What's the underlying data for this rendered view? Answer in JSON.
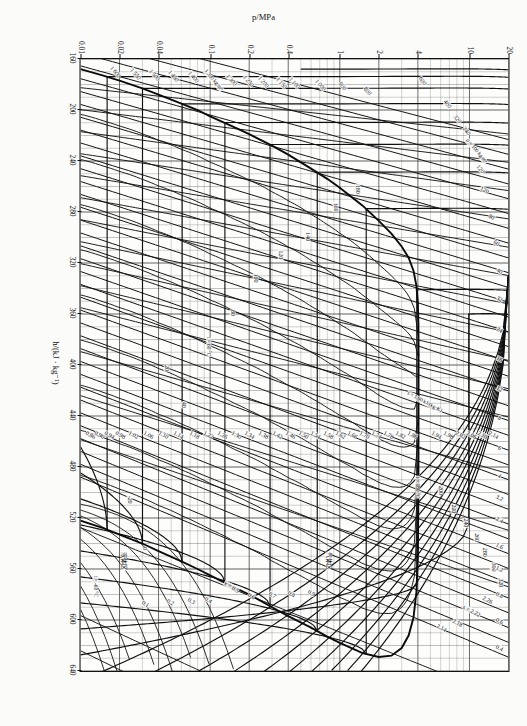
{
  "figure": {
    "kind": "pressure-enthalpy-mollier-diagram",
    "rotation_deg": 90,
    "page_background": "#fbfbfa",
    "ink_color": "#111111"
  },
  "chart_data": {
    "type": "line",
    "title": "",
    "subtitle": "",
    "xlabel": "h/(kJ · kg⁻¹)",
    "ylabel": "p/MPa",
    "xlim": [
      160,
      640
    ],
    "ylim": [
      0.01,
      20
    ],
    "yscale": "log",
    "grid": true,
    "legend_position": "none",
    "x_ticks": [
      160,
      200,
      240,
      280,
      320,
      360,
      400,
      440,
      480,
      520,
      560,
      600,
      640
    ],
    "x_tick_labels": [
      "160",
      "200",
      "240",
      "280",
      "320",
      "360",
      "400",
      "440",
      "480",
      "520",
      "560",
      "600",
      "640"
    ],
    "y_ticks": [
      0.01,
      0.02,
      0.04,
      0.1,
      0.2,
      0.4,
      1,
      2,
      4,
      10,
      20
    ],
    "y_tick_labels": [
      "0.01",
      "0.02",
      "0.04",
      "0.1",
      "0.2",
      "0.4",
      "1",
      "2",
      "4",
      "10",
      "20"
    ],
    "series": [
      {
        "name": "saturation-dome",
        "kind": "saturation boundary",
        "style": "heavy",
        "note": "bell-shaped two-phase envelope with critical point near h=390 kJ/kg, p=4 MPa"
      },
      {
        "name": "isotherms",
        "kind": "constant temperature t / °C",
        "unit": "°C",
        "values": [
          -60,
          -40,
          -20,
          0,
          20,
          40,
          60,
          80,
          100,
          120,
          140,
          160,
          180,
          200,
          220,
          240,
          260,
          280,
          300,
          320
        ],
        "labelled": [
          "t = -60 °C",
          "t = 60 °C",
          "t = 180 °C"
        ]
      },
      {
        "name": "isentropes",
        "kind": "constant entropy s",
        "unit": "kJ/(kg·K)",
        "values": [
          0.86,
          0.9,
          0.94,
          0.98,
          1.02,
          1.06,
          1.1,
          1.14,
          1.18,
          1.22,
          1.26,
          1.3,
          1.34,
          1.38,
          1.42,
          1.46,
          1.5,
          1.54,
          1.58,
          1.62,
          1.66,
          1.7,
          1.74,
          1.78,
          1.82,
          1.86,
          1.9,
          1.94,
          1.98,
          2.02,
          2.06,
          2.1,
          2.14,
          2.18,
          2.22,
          2.26
        ],
        "labelled": [
          "s = 1.90 kJ/(kg·K)",
          "s = 2.22"
        ]
      },
      {
        "name": "isochores",
        "kind": "constant specific volume v",
        "unit": "dm³/kg",
        "values": [
          0.4,
          0.6,
          0.8,
          1.2,
          1.6,
          2.4,
          3.2,
          4,
          6,
          8,
          10,
          12,
          16,
          24,
          32
        ]
      },
      {
        "name": "isodensity-liquid",
        "kind": "constant density ρ",
        "unit": "kg/m³",
        "values": [
          100,
          120,
          240,
          320,
          400,
          600,
          800,
          900,
          1000,
          1100,
          1150,
          1200,
          1250,
          1300,
          1350,
          1400,
          1450,
          1500,
          1550,
          1600
        ],
        "labelled": [
          "ρ = 100 kg/m³",
          "1 350 kg/m³"
        ]
      },
      {
        "name": "quality-lines",
        "kind": "constant vapour quality x",
        "values": [
          0.1,
          0.2,
          0.3,
          0.4,
          0.5,
          0.6,
          0.7,
          0.8,
          0.9
        ],
        "labelled": [
          "x = 0.5"
        ]
      }
    ]
  },
  "axes": {
    "x": {
      "title": "h/(kJ · kg⁻¹)",
      "ticks": [
        {
          "v": 160,
          "label": "160"
        },
        {
          "v": 200,
          "label": "200"
        },
        {
          "v": 240,
          "label": "240"
        },
        {
          "v": 280,
          "label": "280"
        },
        {
          "v": 320,
          "label": "320"
        },
        {
          "v": 360,
          "label": "360"
        },
        {
          "v": 400,
          "label": "400"
        },
        {
          "v": 440,
          "label": "440"
        },
        {
          "v": 480,
          "label": "480"
        },
        {
          "v": 520,
          "label": "520"
        },
        {
          "v": 560,
          "label": "560"
        },
        {
          "v": 600,
          "label": "600"
        },
        {
          "v": 640,
          "label": "640"
        }
      ]
    },
    "y": {
      "title": "p/MPa",
      "ticks": [
        {
          "v": 0.01,
          "label": "0.01"
        },
        {
          "v": 0.02,
          "label": "0.02"
        },
        {
          "v": 0.04,
          "label": "0.04"
        },
        {
          "v": 0.1,
          "label": "0.1"
        },
        {
          "v": 0.2,
          "label": "0.2"
        },
        {
          "v": 0.4,
          "label": "0.4"
        },
        {
          "v": 1,
          "label": "1"
        },
        {
          "v": 2,
          "label": "2"
        },
        {
          "v": 4,
          "label": "4"
        },
        {
          "v": 10,
          "label": "10"
        },
        {
          "v": 20,
          "label": "20"
        }
      ]
    }
  },
  "annotations": {
    "isotherm_labels": [
      {
        "text": "t = -60 °C",
        "x": 0.862,
        "y": 0.965
      },
      {
        "text": "-20",
        "x": 0.72,
        "y": 0.886
      },
      {
        "text": "0",
        "x": 0.8,
        "y": 0.85
      },
      {
        "text": "20",
        "x": 0.505,
        "y": 0.8
      },
      {
        "text": "40",
        "x": 0.565,
        "y": 0.76
      },
      {
        "text": "t = 60 °C",
        "x": 0.47,
        "y": 0.7
      },
      {
        "text": "80",
        "x": 0.415,
        "y": 0.645
      },
      {
        "text": "100",
        "x": 0.358,
        "y": 0.59
      },
      {
        "text": "120",
        "x": 0.32,
        "y": 0.532
      },
      {
        "text": "140",
        "x": 0.29,
        "y": 0.47
      },
      {
        "text": "160",
        "x": 0.242,
        "y": 0.405
      },
      {
        "text": "180",
        "x": 0.213,
        "y": 0.352
      },
      {
        "text": "t = 180 °C",
        "x": 0.7,
        "y": 0.212
      },
      {
        "text": "200",
        "x": 0.705,
        "y": 0.158
      },
      {
        "text": "220",
        "x": 0.735,
        "y": 0.128
      },
      {
        "text": "240",
        "x": 0.758,
        "y": 0.1
      },
      {
        "text": "260",
        "x": 0.782,
        "y": 0.075
      },
      {
        "text": "280",
        "x": 0.806,
        "y": 0.055
      },
      {
        "text": "300",
        "x": 0.83,
        "y": 0.036
      },
      {
        "text": "320",
        "x": 0.856,
        "y": 0.019
      }
    ],
    "entropy_labels": [
      {
        "text": "0.86",
        "x": 0.614,
        "y": 0.976
      },
      {
        "text": "0.90",
        "x": 0.614,
        "y": 0.955
      },
      {
        "text": "0.94",
        "x": 0.614,
        "y": 0.932
      },
      {
        "text": "0.98",
        "x": 0.614,
        "y": 0.906
      },
      {
        "text": "1.02",
        "x": 0.614,
        "y": 0.876
      },
      {
        "text": "1.06",
        "x": 0.614,
        "y": 0.842
      },
      {
        "text": "1.10",
        "x": 0.614,
        "y": 0.806
      },
      {
        "text": "1.14",
        "x": 0.614,
        "y": 0.77
      },
      {
        "text": "1.18",
        "x": 0.614,
        "y": 0.734
      },
      {
        "text": "1.22",
        "x": 0.614,
        "y": 0.7
      },
      {
        "text": "1.26",
        "x": 0.614,
        "y": 0.668
      },
      {
        "text": "1.30",
        "x": 0.614,
        "y": 0.636
      },
      {
        "text": "1.34",
        "x": 0.614,
        "y": 0.604
      },
      {
        "text": "1.38",
        "x": 0.614,
        "y": 0.572
      },
      {
        "text": "1.42",
        "x": 0.614,
        "y": 0.54
      },
      {
        "text": "1.46",
        "x": 0.614,
        "y": 0.51
      },
      {
        "text": "1.50",
        "x": 0.614,
        "y": 0.48
      },
      {
        "text": "1.54",
        "x": 0.614,
        "y": 0.45
      },
      {
        "text": "1.58",
        "x": 0.614,
        "y": 0.42
      },
      {
        "text": "1.62",
        "x": 0.614,
        "y": 0.392
      },
      {
        "text": "1.66",
        "x": 0.614,
        "y": 0.364
      },
      {
        "text": "1.70",
        "x": 0.614,
        "y": 0.336
      },
      {
        "text": "1.74",
        "x": 0.614,
        "y": 0.308
      },
      {
        "text": "1.78",
        "x": 0.614,
        "y": 0.28
      },
      {
        "text": "1.82",
        "x": 0.614,
        "y": 0.252
      },
      {
        "text": "1.86",
        "x": 0.614,
        "y": 0.224
      },
      {
        "text": "s = 1.90 kJ/(kg·K)",
        "x": 0.56,
        "y": 0.196
      },
      {
        "text": "1.94",
        "x": 0.614,
        "y": 0.168
      },
      {
        "text": "1.98",
        "x": 0.614,
        "y": 0.14
      },
      {
        "text": "2.02",
        "x": 0.614,
        "y": 0.112
      },
      {
        "text": "2.06",
        "x": 0.614,
        "y": 0.086
      },
      {
        "text": "2.10",
        "x": 0.614,
        "y": 0.06
      },
      {
        "text": "2.14",
        "x": 0.614,
        "y": 0.034
      },
      {
        "text": "s = 2.22",
        "x": 0.902,
        "y": 0.086
      },
      {
        "text": "2.18",
        "x": 0.922,
        "y": 0.12
      },
      {
        "text": "2.14",
        "x": 0.93,
        "y": 0.156
      },
      {
        "text": "2.26",
        "x": 0.884,
        "y": 0.05
      }
    ],
    "isochore_labels": [
      {
        "text": "0.4",
        "x": 0.962,
        "y": 0.02
      },
      {
        "text": "0.6",
        "x": 0.918,
        "y": 0.02
      },
      {
        "text": "0.8",
        "x": 0.876,
        "y": 0.02
      },
      {
        "text": "1.2",
        "x": 0.834,
        "y": 0.02
      },
      {
        "text": "1.6",
        "x": 0.796,
        "y": 0.02
      },
      {
        "text": "2.4",
        "x": 0.754,
        "y": 0.02
      },
      {
        "text": "3.2",
        "x": 0.718,
        "y": 0.02
      },
      {
        "text": "4",
        "x": 0.682,
        "y": 0.02
      },
      {
        "text": "6",
        "x": 0.636,
        "y": 0.02
      },
      {
        "text": "8",
        "x": 0.586,
        "y": 0.02
      },
      {
        "text": "12",
        "x": 0.54,
        "y": 0.02
      },
      {
        "text": "16",
        "x": 0.49,
        "y": 0.02
      },
      {
        "text": "24",
        "x": 0.442,
        "y": 0.02
      },
      {
        "text": "32",
        "x": 0.392,
        "y": 0.02
      },
      {
        "text": "40",
        "x": 0.346,
        "y": 0.02
      },
      {
        "text": "60",
        "x": 0.3,
        "y": 0.028
      },
      {
        "text": "80",
        "x": 0.258,
        "y": 0.04
      },
      {
        "text": "120",
        "x": 0.214,
        "y": 0.057
      }
    ],
    "density_labels": [
      {
        "text": "ρ = 100 kg/m³",
        "x": 0.15,
        "y": 0.075
      },
      {
        "text": "120",
        "x": 0.18,
        "y": 0.066
      },
      {
        "text": "240",
        "x": 0.118,
        "y": 0.098
      },
      {
        "text": "320",
        "x": 0.098,
        "y": 0.12
      },
      {
        "text": "400",
        "x": 0.074,
        "y": 0.142
      },
      {
        "text": "600",
        "x": 0.036,
        "y": 0.2
      },
      {
        "text": "800",
        "x": 0.052,
        "y": 0.33
      },
      {
        "text": "900",
        "x": 0.044,
        "y": 0.388
      },
      {
        "text": "1 000",
        "x": 0.042,
        "y": 0.44
      },
      {
        "text": "1 100",
        "x": 0.04,
        "y": 0.5
      },
      {
        "text": "1 150",
        "x": 0.04,
        "y": 0.53
      },
      {
        "text": "1 200",
        "x": 0.038,
        "y": 0.572
      },
      {
        "text": "1 250",
        "x": 0.036,
        "y": 0.608
      },
      {
        "text": "1 300",
        "x": 0.034,
        "y": 0.648
      },
      {
        "text": "1 350 kg/m³",
        "x": 0.034,
        "y": 0.69
      },
      {
        "text": "1 400",
        "x": 0.03,
        "y": 0.736
      },
      {
        "text": "1 450",
        "x": 0.028,
        "y": 0.782
      },
      {
        "text": "1 500",
        "x": 0.026,
        "y": 0.826
      },
      {
        "text": "1 550",
        "x": 0.024,
        "y": 0.872
      },
      {
        "text": "1 600",
        "x": 0.022,
        "y": 0.918
      }
    ],
    "quality_labels": [
      {
        "text": "0.1",
        "x": 0.89,
        "y": 0.848
      },
      {
        "text": "0.2",
        "x": 0.888,
        "y": 0.79
      },
      {
        "text": "0.3",
        "x": 0.886,
        "y": 0.74
      },
      {
        "text": "0.4",
        "x": 0.884,
        "y": 0.7
      },
      {
        "text": "x = 0.5",
        "x": 0.862,
        "y": 0.648
      },
      {
        "text": "0.6",
        "x": 0.878,
        "y": 0.6
      },
      {
        "text": "0.7",
        "x": 0.876,
        "y": 0.552
      },
      {
        "text": "0.8",
        "x": 0.874,
        "y": 0.506
      },
      {
        "text": "0.9",
        "x": 0.872,
        "y": 0.46
      }
    ],
    "misc_labels": [
      {
        "text": "液体区",
        "x": 0.82,
        "y": 0.9
      },
      {
        "text": "气体区",
        "x": 0.82,
        "y": 0.42
      }
    ]
  }
}
